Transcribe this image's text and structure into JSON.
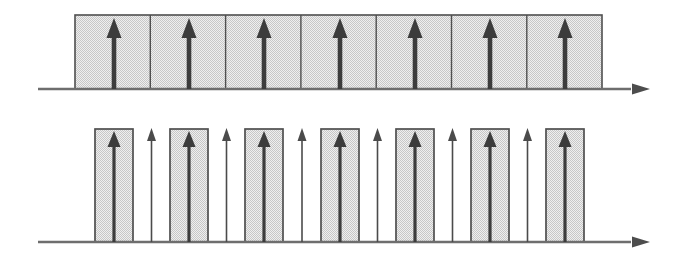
{
  "diagram": {
    "title_semantic": "impulse-train sampling diagram, two rows, no visible text",
    "canvas": {
      "width": 677,
      "height": 260,
      "background": "#ffffff"
    },
    "colors": {
      "axis": "#6e6e6e",
      "axis_head": "#4d4d4d",
      "arrow_bold": "#3c3c3c",
      "arrow_thin": "#4b4b4b",
      "rect_border": "#4f4f4f",
      "checker_light": "#efefef",
      "checker_dark": "#c7c7c7"
    },
    "top_row": {
      "description": "contiguous shaded band of 7 cells, one bold up-arrow per cell, on horizontal axis with right arrowhead",
      "axis": {
        "x1": 38,
        "x2": 631,
        "y": 89,
        "thickness": 2.4,
        "head_tip_x": 650,
        "head_length": 18,
        "head_half_height": 5.5
      },
      "band": {
        "left": 75,
        "right": 602,
        "top": 15,
        "border_width": 1.6
      },
      "dividers": [
        150.3,
        225.6,
        300.9,
        376.2,
        451.5,
        526.8
      ],
      "arrows": {
        "x": [
          114,
          189,
          264,
          340,
          415,
          490,
          565
        ],
        "tip_y": 18,
        "color": "#3c3c3c",
        "shaft_w": 4.6,
        "head_w": 15,
        "head_h": 20
      }
    },
    "bottom_row": {
      "description": "7 narrow shaded pulse rectangles with bold up-arrows, alternating with 6 bare thin up-arrows, on horizontal axis with right arrowhead",
      "axis": {
        "x1": 38,
        "x2": 631,
        "y": 242,
        "thickness": 2.4,
        "head_tip_x": 650,
        "head_length": 18,
        "head_half_height": 5.5
      },
      "rects": {
        "centers": [
          114,
          189,
          264,
          340,
          415,
          490,
          565
        ],
        "width": 38,
        "top": 129,
        "border_width": 1.7
      },
      "bold_arrows": {
        "x": [
          114,
          189,
          264,
          340,
          415,
          490,
          565
        ],
        "tip_y": 131,
        "color": "#3c3c3c",
        "shaft_w": 3.2,
        "head_w": 13,
        "head_h": 16
      },
      "thin_arrows": {
        "x": [
          151.5,
          226.5,
          302,
          377.5,
          452.5,
          527.5
        ],
        "tip_y": 128,
        "color": "#4b4b4b",
        "shaft_w": 1.6,
        "head_w": 9,
        "head_h": 13
      }
    }
  }
}
